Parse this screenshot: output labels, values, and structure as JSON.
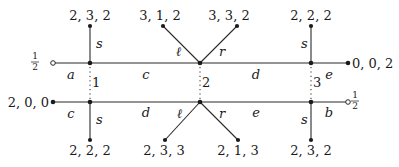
{
  "diagram": {
    "top": {
      "left_terminal": {
        "label_num": "1",
        "label_den": "2",
        "type": "open"
      },
      "right_terminal": {
        "label": "0, 0, 2",
        "type": "filled"
      },
      "edges": {
        "a": "a",
        "c": "c",
        "d": "d",
        "e": "e"
      },
      "branches": [
        {
          "vertex": "1",
          "edge": "s",
          "end_label": "2, 3, 2"
        },
        {
          "vertex": "2",
          "edge": "ℓ",
          "end_label": "3, 1, 2"
        },
        {
          "vertex": "2",
          "edge": "r",
          "end_label": "3, 3, 2"
        },
        {
          "vertex": "3",
          "edge": "s",
          "end_label": "2, 2, 2"
        }
      ]
    },
    "bottom": {
      "left_terminal": {
        "label": "2, 0, 0",
        "type": "filled"
      },
      "right_terminal": {
        "label_num": "1",
        "label_den": "2",
        "type": "open"
      },
      "edges": {
        "c": "c",
        "d": "d",
        "e": "e",
        "b": "b"
      },
      "branches": [
        {
          "vertex": "1",
          "edge": "s",
          "end_label": "2, 2, 2"
        },
        {
          "vertex": "2",
          "edge": "ℓ",
          "end_label": "2, 3, 3"
        },
        {
          "vertex": "2",
          "edge": "r",
          "end_label": "2, 1, 3"
        },
        {
          "vertex": "3",
          "edge": "s",
          "end_label": "2, 3, 2"
        }
      ]
    },
    "vertex_labels": [
      "1",
      "2",
      "3"
    ]
  }
}
